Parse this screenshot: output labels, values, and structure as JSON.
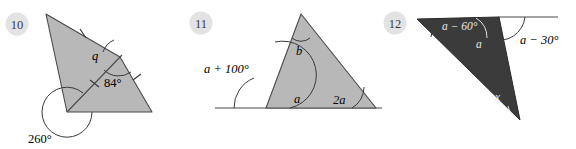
{
  "page": {
    "background_color": "#ffffff",
    "width": 576,
    "height": 149
  },
  "style_colors": {
    "badge_fill": "#e3e3e3",
    "light_shape_fill": "#b8b8b8",
    "dark_shape_fill": "#3b3b3b",
    "stroke": "#4a4a4a",
    "text": "#000000",
    "text_on_dark": "#f0f0f0"
  },
  "problems": [
    {
      "number": "10",
      "shape": "triangle-with-cevian",
      "fill": "light",
      "labels": [
        {
          "name": "angle-q",
          "text": "q",
          "style": "italic"
        },
        {
          "name": "angle-84",
          "text": "84°",
          "style": "roman"
        },
        {
          "name": "angle-260-reflex",
          "text": "260°",
          "style": "roman"
        }
      ],
      "tick_marks": 3,
      "arcs": [
        "q-arc",
        "84-arc",
        "260-reflex-arc"
      ]
    },
    {
      "number": "11",
      "shape": "triangle-on-baseline",
      "fill": "light",
      "labels": [
        {
          "name": "angle-b",
          "text": "b",
          "style": "italic"
        },
        {
          "name": "angle-a",
          "text": "a",
          "style": "italic"
        },
        {
          "name": "angle-a-plus-100",
          "text": "a + 100°",
          "style": "italic"
        },
        {
          "name": "angle-2a",
          "text": "2a",
          "style": "italic"
        }
      ],
      "arcs": [
        "b-arc",
        "a-arc",
        "a-plus-100-arc",
        "2a-arc"
      ]
    },
    {
      "number": "12",
      "shape": "obtuse-triangle-on-baseline",
      "fill": "dark",
      "labels": [
        {
          "name": "angle-a-minus-60",
          "text": "a − 60°",
          "style": "italic-white"
        },
        {
          "name": "angle-a",
          "text": "a",
          "style": "italic-white"
        },
        {
          "name": "angle-a-minus-30",
          "text": "a − 30°",
          "style": "italic"
        },
        {
          "name": "angle-x",
          "text": "x",
          "style": "italic-white"
        }
      ],
      "arcs": [
        "a-minus-60-arc",
        "a-arc",
        "a-minus-30-arc",
        "x-arc"
      ]
    }
  ]
}
